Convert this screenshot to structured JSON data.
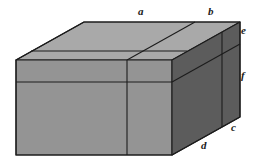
{
  "figure": {
    "name": "labeled-rectangular-box-diagram",
    "type": "3d-cuboid-oblique-projection",
    "background": "#ffffff",
    "faces": {
      "top": {
        "name": "top-face",
        "fill": "#a9a9a9"
      },
      "top_back_strip": {
        "name": "top-back-strip-face",
        "fill": "#a3a3a3"
      },
      "front": {
        "name": "front-face",
        "fill": "#949494"
      },
      "front_top_strip": {
        "name": "front-top-strip-face",
        "fill": "#9c9c9c"
      },
      "right": {
        "name": "right-face",
        "fill": "#5c5c5c"
      },
      "right_end": {
        "name": "right-end-face",
        "fill": "#585858"
      }
    },
    "stroke": "#1c1c1c",
    "stroke_width": 1.1,
    "labels": [
      {
        "id": "a",
        "text": "a",
        "x": 138,
        "y": 6,
        "edge": "top-back-left-segment"
      },
      {
        "id": "b",
        "text": "b",
        "x": 208,
        "y": 6,
        "edge": "top-back-right-segment"
      },
      {
        "id": "e",
        "text": "e",
        "x": 241,
        "y": 25,
        "edge": "right-upper-vertical-segment"
      },
      {
        "id": "f",
        "text": "f",
        "x": 241,
        "y": 70,
        "edge": "right-lower-vertical-segment"
      },
      {
        "id": "c",
        "text": "c",
        "x": 231,
        "y": 122,
        "edge": "bottom-right-short-segment"
      },
      {
        "id": "d",
        "text": "d",
        "x": 201,
        "y": 140,
        "edge": "bottom-right-long-segment"
      }
    ]
  }
}
